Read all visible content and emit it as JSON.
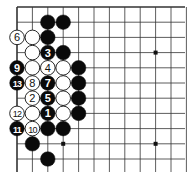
{
  "diagram": {
    "grid": {
      "origin_x": 17,
      "origin_y": 7,
      "spacing_x": 15.4,
      "spacing_y": 15.2,
      "cols": 12,
      "rows": 11,
      "line_color": "#333333",
      "edge_left": true,
      "edge_top": true
    },
    "star_points": [
      {
        "col": 3,
        "row": 3
      },
      {
        "col": 9,
        "row": 3
      },
      {
        "col": 3,
        "row": 9
      },
      {
        "col": 9,
        "row": 9
      }
    ],
    "stones": [
      {
        "col": 2,
        "row": 1,
        "color": "black",
        "label": ""
      },
      {
        "col": 3,
        "row": 1,
        "color": "black",
        "label": ""
      },
      {
        "col": 0,
        "row": 2,
        "color": "white",
        "label": "6"
      },
      {
        "col": 1,
        "row": 2,
        "color": "white",
        "label": ""
      },
      {
        "col": 2,
        "row": 2,
        "color": "black",
        "label": ""
      },
      {
        "col": 1,
        "row": 3,
        "color": "white",
        "label": ""
      },
      {
        "col": 2,
        "row": 3,
        "color": "black",
        "label": "3"
      },
      {
        "col": 3,
        "row": 3,
        "color": "black",
        "label": ""
      },
      {
        "col": 0,
        "row": 4,
        "color": "black",
        "label": "9"
      },
      {
        "col": 1,
        "row": 4,
        "color": "white",
        "label": ""
      },
      {
        "col": 2,
        "row": 4,
        "color": "white",
        "label": "4"
      },
      {
        "col": 3,
        "row": 4,
        "color": "white",
        "label": ""
      },
      {
        "col": 4,
        "row": 4,
        "color": "black",
        "label": ""
      },
      {
        "col": 0,
        "row": 5,
        "color": "black",
        "label": "13"
      },
      {
        "col": 1,
        "row": 5,
        "color": "white",
        "label": "8"
      },
      {
        "col": 2,
        "row": 5,
        "color": "black",
        "label": "7"
      },
      {
        "col": 3,
        "row": 5,
        "color": "white",
        "label": ""
      },
      {
        "col": 4,
        "row": 5,
        "color": "black",
        "label": ""
      },
      {
        "col": 1,
        "row": 6,
        "color": "white",
        "label": "2"
      },
      {
        "col": 2,
        "row": 6,
        "color": "black",
        "label": "5"
      },
      {
        "col": 3,
        "row": 6,
        "color": "white",
        "label": ""
      },
      {
        "col": 4,
        "row": 6,
        "color": "black",
        "label": ""
      },
      {
        "col": 0,
        "row": 7,
        "color": "white",
        "label": "12"
      },
      {
        "col": 1,
        "row": 7,
        "color": "white",
        "label": ""
      },
      {
        "col": 2,
        "row": 7,
        "color": "black",
        "label": "1"
      },
      {
        "col": 3,
        "row": 7,
        "color": "white",
        "label": ""
      },
      {
        "col": 4,
        "row": 7,
        "color": "black",
        "label": ""
      },
      {
        "col": 0,
        "row": 8,
        "color": "black",
        "label": "11"
      },
      {
        "col": 1,
        "row": 8,
        "color": "white",
        "label": "10"
      },
      {
        "col": 2,
        "row": 8,
        "color": "black",
        "label": ""
      },
      {
        "col": 3,
        "row": 8,
        "color": "black",
        "label": ""
      },
      {
        "col": 1,
        "row": 9,
        "color": "black",
        "label": ""
      },
      {
        "col": 2,
        "row": 10,
        "color": "black",
        "label": ""
      }
    ]
  }
}
